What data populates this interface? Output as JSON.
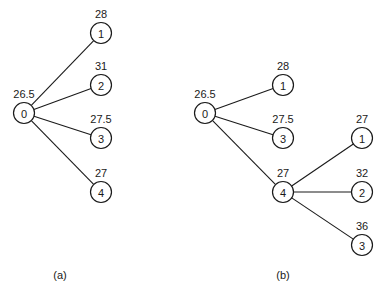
{
  "style": {
    "line_color": "#1a1a1a",
    "background": "#ffffff",
    "node_radius": 10.5
  },
  "diagrams": [
    {
      "caption": "(a)",
      "caption_pos": [
        60,
        279
      ],
      "nodes": [
        {
          "key": "a0",
          "id": "0",
          "value": "26.5",
          "x": 24,
          "y": 113,
          "value_dx": 0
        },
        {
          "key": "a1",
          "id": "1",
          "value": "28",
          "x": 101,
          "y": 33,
          "value_dx": 0
        },
        {
          "key": "a2",
          "id": "2",
          "value": "31",
          "x": 101,
          "y": 85,
          "value_dx": 0
        },
        {
          "key": "a3",
          "id": "3",
          "value": "27.5",
          "x": 101,
          "y": 138,
          "value_dx": 0
        },
        {
          "key": "a4",
          "id": "4",
          "value": "27",
          "x": 101,
          "y": 192,
          "value_dx": 0
        }
      ],
      "edges": [
        [
          "a0",
          "a1"
        ],
        [
          "a0",
          "a2"
        ],
        [
          "a0",
          "a3"
        ],
        [
          "a0",
          "a4"
        ]
      ]
    },
    {
      "caption": "(b)",
      "caption_pos": [
        283,
        279
      ],
      "nodes": [
        {
          "key": "b0",
          "id": "0",
          "value": "26.5",
          "x": 205,
          "y": 113,
          "value_dx": 0
        },
        {
          "key": "b1",
          "id": "1",
          "value": "28",
          "x": 283,
          "y": 85,
          "value_dx": 0
        },
        {
          "key": "b3",
          "id": "3",
          "value": "27.5",
          "x": 283,
          "y": 138,
          "value_dx": 0
        },
        {
          "key": "b4",
          "id": "4",
          "value": "27",
          "x": 283,
          "y": 192,
          "value_dx": 0
        },
        {
          "key": "b41",
          "id": "1",
          "value": "27",
          "x": 362,
          "y": 138,
          "value_dx": 0
        },
        {
          "key": "b42",
          "id": "2",
          "value": "32",
          "x": 362,
          "y": 192,
          "value_dx": 0
        },
        {
          "key": "b43",
          "id": "3",
          "value": "36",
          "x": 362,
          "y": 245,
          "value_dx": 0
        }
      ],
      "edges": [
        [
          "b0",
          "b1"
        ],
        [
          "b0",
          "b3"
        ],
        [
          "b0",
          "b4"
        ],
        [
          "b4",
          "b41"
        ],
        [
          "b4",
          "b42"
        ],
        [
          "b4",
          "b43"
        ]
      ]
    }
  ]
}
